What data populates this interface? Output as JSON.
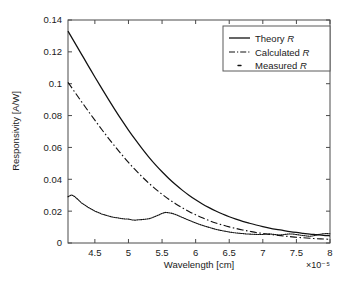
{
  "chart_data": {
    "type": "line",
    "title": "",
    "xlabel": "Wavelength [cm]",
    "ylabel": "Responsivity [A/W]",
    "x_exponent_label": "×10⁻⁵",
    "xlim": [
      4.1,
      8.0
    ],
    "ylim": [
      0.0,
      0.14
    ],
    "xticks": [
      4.5,
      5,
      5.5,
      6,
      6.5,
      7,
      7.5,
      8
    ],
    "xticklabels": [
      "4.5",
      "5",
      "5.5",
      "6",
      "6.5",
      "7",
      "7.5",
      "8"
    ],
    "yticks": [
      0,
      0.02,
      0.04,
      0.06,
      0.08,
      0.1,
      0.12,
      0.14
    ],
    "yticklabels": [
      "0",
      "0.02",
      "0.04",
      "0.06",
      "0.08",
      "0.1",
      "0.12",
      "0.14"
    ],
    "grid": false,
    "legend_position": "upper right",
    "series": [
      {
        "name": "Theory R",
        "style": "solid",
        "x": [
          4.1,
          4.2,
          4.3,
          4.4,
          4.5,
          4.6,
          4.7,
          4.8,
          4.9,
          5.0,
          5.1,
          5.2,
          5.3,
          5.4,
          5.5,
          5.6,
          5.7,
          5.8,
          5.9,
          6.0,
          6.1,
          6.2,
          6.3,
          6.4,
          6.5,
          6.6,
          6.7,
          6.8,
          6.9,
          7.0,
          7.1,
          7.2,
          7.3,
          7.4,
          7.5,
          7.6,
          7.7,
          7.8,
          7.9,
          8.0
        ],
        "values": [
          0.133,
          0.1258,
          0.1186,
          0.1114,
          0.1042,
          0.0972,
          0.0903,
          0.0836,
          0.0771,
          0.0709,
          0.065,
          0.0594,
          0.0541,
          0.0492,
          0.0447,
          0.0405,
          0.0367,
          0.0332,
          0.03,
          0.0271,
          0.0245,
          0.0222,
          0.0201,
          0.0182,
          0.0165,
          0.015,
          0.0136,
          0.0124,
          0.0113,
          0.0103,
          0.0094,
          0.0086,
          0.0079,
          0.0072,
          0.0066,
          0.0061,
          0.0056,
          0.0052,
          0.0048,
          0.0045
        ]
      },
      {
        "name": "Calculated R",
        "style": "dash-dot",
        "x": [
          4.1,
          4.2,
          4.3,
          4.4,
          4.5,
          4.6,
          4.7,
          4.8,
          4.9,
          5.0,
          5.1,
          5.2,
          5.3,
          5.4,
          5.5,
          5.6,
          5.7,
          5.8,
          5.9,
          6.0,
          6.1,
          6.2,
          6.3,
          6.4,
          6.5,
          6.6,
          6.7,
          6.8,
          6.9,
          7.0,
          7.1,
          7.2,
          7.3,
          7.4,
          7.5,
          7.6,
          7.7,
          7.8,
          7.9,
          8.0
        ],
        "values": [
          0.1008,
          0.0948,
          0.0888,
          0.0829,
          0.0771,
          0.0714,
          0.0659,
          0.0606,
          0.0555,
          0.0506,
          0.046,
          0.0417,
          0.0377,
          0.034,
          0.0306,
          0.0275,
          0.0247,
          0.0221,
          0.0198,
          0.0177,
          0.0158,
          0.0141,
          0.0126,
          0.0113,
          0.0101,
          0.0091,
          0.0082,
          0.0074,
          0.0066,
          0.006,
          0.0054,
          0.0049,
          0.0044,
          0.004,
          0.0036,
          0.0033,
          0.003,
          0.0027,
          0.0025,
          0.0023
        ]
      },
      {
        "name": "Measured R",
        "style": "dotted",
        "x": [
          4.1,
          4.15,
          4.2,
          4.25,
          4.3,
          4.35,
          4.4,
          4.45,
          4.5,
          4.55,
          4.6,
          4.65,
          4.7,
          4.75,
          4.8,
          4.85,
          4.9,
          4.95,
          5.0,
          5.05,
          5.1,
          5.15,
          5.2,
          5.25,
          5.3,
          5.35,
          5.4,
          5.45,
          5.5,
          5.55,
          5.6,
          5.65,
          5.7,
          5.75,
          5.8,
          5.85,
          5.9,
          5.95,
          6.0,
          6.05,
          6.1,
          6.15,
          6.2,
          6.25,
          6.3,
          6.35,
          6.4,
          6.45,
          6.5,
          6.55,
          6.6,
          6.65,
          6.7,
          6.75,
          6.8,
          6.85,
          6.9,
          6.95,
          7.0,
          7.05,
          7.1,
          7.15,
          7.2,
          7.25,
          7.3,
          7.35,
          7.4,
          7.45,
          7.5,
          7.55,
          7.6,
          7.65,
          7.7,
          7.75,
          7.8,
          7.85,
          7.9,
          7.95,
          8.0
        ],
        "values": [
          0.029,
          0.0302,
          0.0292,
          0.0272,
          0.0252,
          0.0238,
          0.0224,
          0.0212,
          0.02,
          0.0192,
          0.0182,
          0.0176,
          0.017,
          0.0164,
          0.016,
          0.0157,
          0.0153,
          0.0151,
          0.015,
          0.0145,
          0.0143,
          0.0146,
          0.0147,
          0.0149,
          0.0152,
          0.0158,
          0.0167,
          0.0176,
          0.0186,
          0.0192,
          0.019,
          0.0186,
          0.0179,
          0.017,
          0.0161,
          0.0152,
          0.0143,
          0.0134,
          0.0126,
          0.0118,
          0.0111,
          0.0104,
          0.0098,
          0.0092,
          0.0086,
          0.0081,
          0.0077,
          0.0073,
          0.0069,
          0.0066,
          0.0063,
          0.0061,
          0.0059,
          0.0057,
          0.0056,
          0.0055,
          0.0054,
          0.0053,
          0.0054,
          0.0056,
          0.0057,
          0.0055,
          0.0052,
          0.005,
          0.0052,
          0.0055,
          0.0057,
          0.0056,
          0.0053,
          0.005,
          0.0047,
          0.0044,
          0.0042,
          0.0045,
          0.005,
          0.0055,
          0.0058,
          0.0059,
          0.0058
        ]
      }
    ]
  },
  "legend": {
    "items": [
      {
        "label_main": "Theory ",
        "label_italic": "R"
      },
      {
        "label_main": "Calculated ",
        "label_italic": "R"
      },
      {
        "label_main": "Measured ",
        "label_italic": "R"
      }
    ]
  },
  "colors": {
    "line": "#111111",
    "axis": "#4a4a4a",
    "background": "#ffffff",
    "text": "#1a1a1a"
  }
}
